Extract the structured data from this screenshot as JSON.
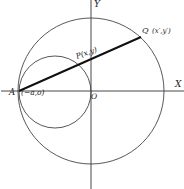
{
  "diagram": {
    "type": "geometry",
    "axes": {
      "x_label": "X",
      "y_label": "Y"
    },
    "points": {
      "A": {
        "label": "A",
        "coords": "(−a,o)"
      },
      "O": {
        "label": "O"
      },
      "P": {
        "label": "P(x,y)"
      },
      "Q": {
        "label": "Q",
        "coords": "(x′,y′)"
      }
    },
    "circles": [
      {
        "name": "large circle",
        "center": "O"
      },
      {
        "name": "small circle",
        "through": [
          "A",
          "O"
        ]
      }
    ],
    "segments": [
      {
        "from": "A",
        "to": "Q",
        "through": "P",
        "style": "bold"
      }
    ],
    "colors": {
      "ink": "#222222",
      "background": "#ffffff"
    }
  }
}
